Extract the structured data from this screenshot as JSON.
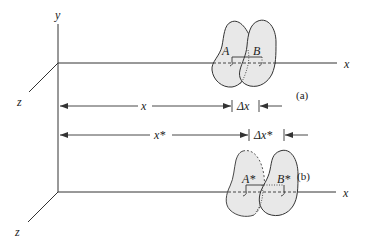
{
  "figure": {
    "panel_a": {
      "label": "(a)",
      "axis_labels": {
        "x": "x",
        "y": "y",
        "z": "z"
      },
      "bodies": [
        {
          "name": "A",
          "label": "A"
        },
        {
          "name": "B",
          "label": "B"
        }
      ]
    },
    "panel_b": {
      "label": "(b)",
      "axis_labels": {
        "x": "x",
        "z": "z"
      },
      "bodies": [
        {
          "name": "A*",
          "label": "A*"
        },
        {
          "name": "B*",
          "label": "B*"
        }
      ]
    },
    "dimensions": {
      "x": "x",
      "delta_x": "Δx",
      "x_star": "x*",
      "delta_x_star": "Δx*"
    }
  },
  "colors": {
    "line": "#333333",
    "body_fill": "#e8e8e8",
    "background": "#ffffff"
  }
}
